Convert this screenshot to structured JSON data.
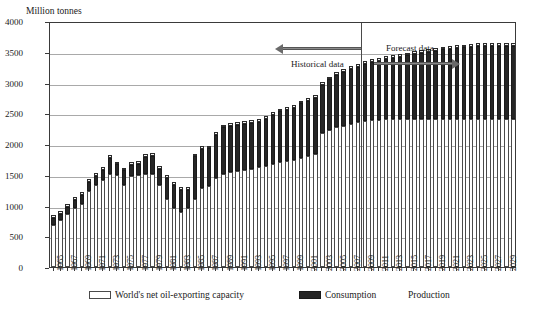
{
  "chart_data": {
    "type": "bar",
    "title": "",
    "subtitle": "",
    "ylabel": "Million tonnes",
    "xlabel": "",
    "ylim": [
      0,
      4000
    ],
    "yticks": [
      0,
      500,
      1000,
      1500,
      2000,
      2500,
      3000,
      3500,
      4000
    ],
    "grid": true,
    "legend_position": "bottom",
    "stacked": true,
    "x_tick_step": 2,
    "annotations": [
      {
        "text": "Historical data",
        "arrow": "left",
        "region": "1965-2008"
      },
      {
        "text": "Forecast data",
        "arrow": "right",
        "region": "2009-2030"
      }
    ],
    "divider_after_year": 2008,
    "legend": [
      {
        "label": "World's net oil-exporting capacity",
        "swatch": "stipple"
      },
      {
        "label": "Consumption",
        "swatch": "black"
      },
      {
        "label": "Production",
        "swatch": "none"
      }
    ],
    "categories": [
      1965,
      1966,
      1967,
      1968,
      1969,
      1970,
      1971,
      1972,
      1973,
      1974,
      1975,
      1976,
      1977,
      1978,
      1979,
      1980,
      1981,
      1982,
      1983,
      1984,
      1985,
      1986,
      1987,
      1988,
      1989,
      1990,
      1991,
      1992,
      1993,
      1994,
      1995,
      1996,
      1997,
      1998,
      1999,
      2000,
      2001,
      2002,
      2003,
      2004,
      2005,
      2006,
      2007,
      2008,
      2009,
      2010,
      2011,
      2012,
      2013,
      2014,
      2015,
      2016,
      2017,
      2018,
      2019,
      2020,
      2021,
      2022,
      2023,
      2024,
      2025,
      2026,
      2027,
      2028,
      2029,
      2030
    ],
    "series": [
      {
        "name": "World's net oil-exporting capacity",
        "swatch": "stipple",
        "values": [
          690,
          760,
          870,
          960,
          1030,
          1240,
          1330,
          1420,
          1510,
          1500,
          1330,
          1480,
          1500,
          1510,
          1510,
          1340,
          1110,
          960,
          890,
          960,
          1110,
          1290,
          1320,
          1440,
          1510,
          1550,
          1560,
          1570,
          1590,
          1620,
          1640,
          1670,
          1700,
          1720,
          1740,
          1780,
          1800,
          1830,
          2180,
          2230,
          2270,
          2300,
          2330,
          2360,
          2380,
          2390,
          2390,
          2400,
          2400,
          2400,
          2400,
          2400,
          2400,
          2400,
          2400,
          2400,
          2400,
          2400,
          2400,
          2400,
          2400,
          2400,
          2400,
          2400,
          2400,
          2400
        ]
      },
      {
        "name": "Consumption",
        "swatch": "black",
        "values": [
          110,
          110,
          110,
          130,
          140,
          140,
          150,
          160,
          260,
          170,
          240,
          180,
          180,
          280,
          300,
          250,
          340,
          380,
          360,
          300,
          690,
          630,
          610,
          710,
          760,
          740,
          750,
          760,
          750,
          740,
          770,
          800,
          830,
          840,
          850,
          880,
          900,
          920,
          780,
          820,
          850,
          870,
          890,
          900,
          920,
          940,
          960,
          980,
          1000,
          1020,
          1040,
          1060,
          1080,
          1100,
          1120,
          1140,
          1150,
          1160,
          1170,
          1180,
          1190,
          1200,
          1200,
          1200,
          1200,
          1200
        ]
      },
      {
        "name": "Production",
        "swatch": "none",
        "values": [
          45,
          45,
          45,
          45,
          45,
          45,
          45,
          45,
          45,
          45,
          45,
          45,
          45,
          45,
          45,
          45,
          45,
          45,
          45,
          45,
          45,
          45,
          45,
          45,
          45,
          45,
          45,
          45,
          45,
          45,
          45,
          45,
          45,
          45,
          45,
          45,
          45,
          45,
          45,
          45,
          45,
          45,
          45,
          45,
          45,
          45,
          45,
          45,
          45,
          45,
          45,
          45,
          45,
          45,
          45,
          45,
          45,
          45,
          45,
          45,
          45,
          45,
          45,
          45,
          45,
          45
        ]
      }
    ]
  }
}
